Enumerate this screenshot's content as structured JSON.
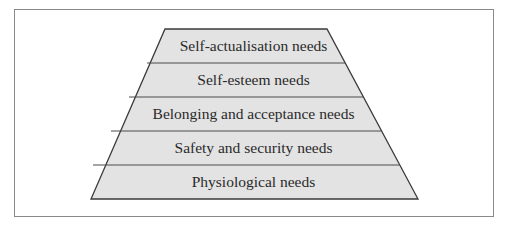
{
  "diagram": {
    "type": "pyramid",
    "levels": [
      {
        "label": "Self-actualisation needs"
      },
      {
        "label": "Self-esteem needs"
      },
      {
        "label": "Belonging and acceptance needs"
      },
      {
        "label": "Safety and security needs"
      },
      {
        "label": "Physiological needs"
      }
    ],
    "colors": {
      "fill": "#e3e3e3",
      "stroke": "#3a3a3a",
      "frame": "#8a8a8a"
    }
  }
}
